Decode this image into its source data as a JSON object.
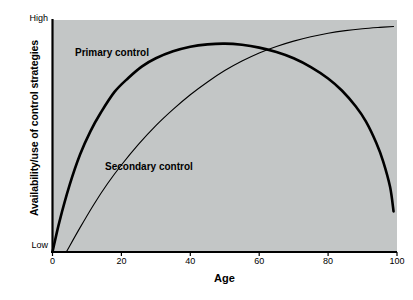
{
  "chart_data": {
    "type": "line",
    "title": "",
    "subtitle": "",
    "xlabel": "Age",
    "ylabel": "Availability/use of control strategies",
    "xlim": [
      0,
      100
    ],
    "ylim": [
      0,
      1
    ],
    "xticks": [
      0,
      20,
      40,
      60,
      80,
      100
    ],
    "xtick_labels": [
      "0",
      "20",
      "40",
      "60",
      "80",
      "100"
    ],
    "ytick_labels": [
      "High",
      "Low"
    ],
    "ytick_high": "High",
    "ytick_low": "Low",
    "grid": false,
    "legend_position": "inline-annotations",
    "plot_background": "#c3c6c6",
    "axis_color": "#000000",
    "series": [
      {
        "name": "Primary control",
        "label": "Primary control",
        "style": "thick",
        "color": "#000000",
        "linewidth": 2.6,
        "x": [
          0,
          2,
          5,
          8,
          11,
          14,
          18,
          22,
          26,
          30,
          35,
          40,
          45,
          50,
          55,
          60,
          65,
          70,
          75,
          80,
          84,
          88,
          91,
          94,
          96,
          98,
          99
        ],
        "y": [
          0.0,
          0.13,
          0.29,
          0.42,
          0.52,
          0.6,
          0.69,
          0.75,
          0.8,
          0.835,
          0.865,
          0.885,
          0.895,
          0.898,
          0.893,
          0.881,
          0.862,
          0.835,
          0.797,
          0.748,
          0.696,
          0.628,
          0.562,
          0.47,
          0.39,
          0.28,
          0.175
        ]
      },
      {
        "name": "Secondary control",
        "label": "Secondary control",
        "style": "thin",
        "color": "#000000",
        "linewidth": 1.1,
        "x": [
          4,
          8,
          12,
          16,
          20,
          25,
          30,
          35,
          40,
          45,
          50,
          55,
          60,
          65,
          70,
          75,
          80,
          85,
          90,
          95,
          99
        ],
        "y": [
          0.0,
          0.105,
          0.205,
          0.295,
          0.375,
          0.465,
          0.545,
          0.615,
          0.678,
          0.733,
          0.782,
          0.823,
          0.858,
          0.886,
          0.909,
          0.928,
          0.943,
          0.954,
          0.962,
          0.968,
          0.972
        ]
      }
    ],
    "annotations": [
      {
        "text": "Primary control",
        "x": 8,
        "y": 0.88
      },
      {
        "text": "Secondary control",
        "x": 16,
        "y": 0.38
      }
    ],
    "crossover": {
      "x": 48,
      "y": 0.9,
      "note": "curves intersect near age 48"
    }
  }
}
